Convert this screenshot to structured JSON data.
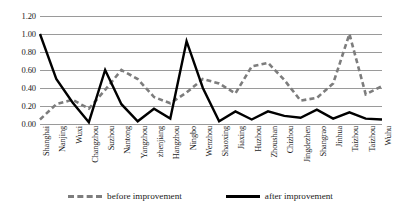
{
  "chart_data": {
    "type": "line",
    "title": "",
    "xlabel": "",
    "ylabel": "",
    "ylim": [
      0.0,
      1.2
    ],
    "yticks": [
      "0.00",
      "0.20",
      "0.40",
      "0.60",
      "0.80",
      "1.00",
      "1.20"
    ],
    "ytick_values": [
      0.0,
      0.2,
      0.4,
      0.6,
      0.8,
      1.0,
      1.2
    ],
    "grid": true,
    "legend_position": "bottom",
    "categories": [
      "Shanghai",
      "Nanjing",
      "Wuxi",
      "Changzhou",
      "Suzhou",
      "Nantong",
      "Yangzhou",
      "zhenjiang",
      "Hangzhou",
      "Ningbo",
      "Wenzhou",
      "Shaoxing",
      "Jiaxing",
      "Huzhou",
      "Zhoushan",
      "Chizhou",
      "Jingdezhen",
      "Shangrao",
      "Jinhua",
      "Taizhou",
      "Taizhou",
      "Wuhu"
    ],
    "series": [
      {
        "name": "before improvement",
        "color": "#7d7d7d",
        "style": "dashed",
        "values": [
          0.05,
          0.22,
          0.27,
          0.17,
          0.38,
          0.6,
          0.5,
          0.3,
          0.23,
          0.35,
          0.5,
          0.45,
          0.34,
          0.64,
          0.68,
          0.49,
          0.26,
          0.29,
          0.45,
          1.0,
          0.33,
          0.42
        ]
      },
      {
        "name": "after improvement",
        "color": "#000000",
        "style": "solid",
        "values": [
          1.0,
          0.5,
          0.24,
          0.02,
          0.6,
          0.22,
          0.03,
          0.17,
          0.06,
          0.92,
          0.4,
          0.03,
          0.14,
          0.05,
          0.14,
          0.09,
          0.07,
          0.16,
          0.06,
          0.13,
          0.06,
          0.05
        ]
      }
    ]
  },
  "legend": {
    "entries": [
      {
        "label": "before improvement"
      },
      {
        "label": "after improvement"
      }
    ]
  }
}
